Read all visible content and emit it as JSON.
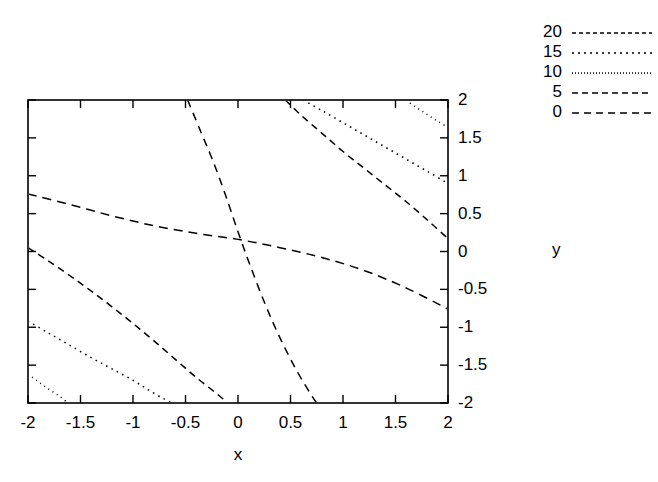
{
  "chart_data": {
    "type": "line",
    "title": "",
    "xlabel": "x",
    "ylabel": "y",
    "xlim": [
      -2,
      2
    ],
    "ylim": [
      -2,
      2
    ],
    "grid": false,
    "legend_position": "top-right",
    "legend_title": "",
    "x_ticks": [
      "-2",
      "-1.5",
      "-1",
      "-0.5",
      "0",
      "0.5",
      "1",
      "1.5",
      "2"
    ],
    "x_tick_values": [
      -2,
      -1.5,
      -1,
      -0.5,
      0,
      0.5,
      1,
      1.5,
      2
    ],
    "y_ticks": [
      "2",
      "1.5",
      "1",
      "0.5",
      "0",
      "-0.5",
      "-1",
      "-1.5",
      "-2"
    ],
    "y_tick_values": [
      2,
      1.5,
      1,
      0.5,
      0,
      -0.5,
      -1,
      -1.5,
      -2
    ],
    "y_axis_side": "right",
    "series": [
      {
        "name": "20",
        "level": 20,
        "dash": "1,4",
        "points": [
          [
            -2,
            -1.62
          ],
          [
            -1.9,
            -1.72
          ],
          [
            -1.8,
            -1.82
          ],
          [
            -1.7,
            -1.91
          ],
          [
            -1.62,
            -2
          ]
        ]
      },
      {
        "name": "20b",
        "level": 20,
        "dash": "1,4",
        "points": [
          [
            1.6,
            2
          ],
          [
            1.7,
            1.9
          ],
          [
            1.8,
            1.81
          ],
          [
            1.9,
            1.72
          ],
          [
            2,
            1.64
          ]
        ]
      },
      {
        "name": "15",
        "level": 15,
        "dash": "1.5,4.5",
        "points": [
          [
            -2,
            -0.92
          ],
          [
            -1.8,
            -1.08
          ],
          [
            -1.6,
            -1.24
          ],
          [
            -1.4,
            -1.4
          ],
          [
            -1.2,
            -1.55
          ],
          [
            -1.0,
            -1.7
          ],
          [
            -0.85,
            -1.83
          ],
          [
            -0.7,
            -1.95
          ],
          [
            -0.62,
            -2
          ]
        ]
      },
      {
        "name": "15b",
        "level": 15,
        "dash": "1.5,4.5",
        "points": [
          [
            0.62,
            2
          ],
          [
            0.8,
            1.86
          ],
          [
            1.0,
            1.7
          ],
          [
            1.2,
            1.54
          ],
          [
            1.4,
            1.38
          ],
          [
            1.6,
            1.22
          ],
          [
            1.8,
            1.06
          ],
          [
            2,
            0.9
          ]
        ]
      },
      {
        "name": "10",
        "level": 10,
        "dash": "7,5",
        "points": [
          [
            -2,
            0.05
          ],
          [
            -1.8,
            -0.13
          ],
          [
            -1.6,
            -0.32
          ],
          [
            -1.4,
            -0.52
          ],
          [
            -1.2,
            -0.73
          ],
          [
            -1.0,
            -0.95
          ],
          [
            -0.8,
            -1.18
          ],
          [
            -0.6,
            -1.42
          ],
          [
            -0.4,
            -1.66
          ],
          [
            -0.2,
            -1.88
          ],
          [
            -0.1,
            -2
          ]
        ]
      },
      {
        "name": "10b",
        "level": 10,
        "dash": "7,5",
        "points": [
          [
            0.45,
            2
          ],
          [
            0.6,
            1.8
          ],
          [
            0.8,
            1.56
          ],
          [
            1.0,
            1.32
          ],
          [
            1.2,
            1.1
          ],
          [
            1.4,
            0.88
          ],
          [
            1.6,
            0.66
          ],
          [
            1.8,
            0.42
          ],
          [
            2,
            0.17
          ]
        ]
      },
      {
        "name": "5",
        "level": 5,
        "dash": "9,6",
        "points": [
          [
            -2,
            0.76
          ],
          [
            -1.6,
            0.62
          ],
          [
            -1.2,
            0.47
          ],
          [
            -0.8,
            0.34
          ],
          [
            -0.4,
            0.24
          ],
          [
            0,
            0.16
          ],
          [
            0.4,
            0.05
          ],
          [
            0.8,
            -0.08
          ],
          [
            1.2,
            -0.25
          ],
          [
            1.6,
            -0.48
          ],
          [
            2,
            -0.76
          ]
        ]
      },
      {
        "name": "0",
        "level": 0,
        "dash": "8,6",
        "points": [
          [
            -0.48,
            2
          ],
          [
            -0.36,
            1.6
          ],
          [
            -0.24,
            1.2
          ],
          [
            -0.12,
            0.75
          ],
          [
            0,
            0.26
          ],
          [
            0.12,
            -0.2
          ],
          [
            0.26,
            -0.7
          ],
          [
            0.4,
            -1.14
          ],
          [
            0.55,
            -1.55
          ],
          [
            0.7,
            -1.9
          ],
          [
            0.75,
            -2
          ]
        ]
      }
    ],
    "legend_entries": [
      {
        "label": "20",
        "dash": "4,3"
      },
      {
        "label": "15",
        "dash": "2,4"
      },
      {
        "label": "10",
        "dash": "1,2"
      },
      {
        "label": "5",
        "dash": "6,4"
      },
      {
        "label": "0",
        "dash": "7,5"
      }
    ]
  }
}
